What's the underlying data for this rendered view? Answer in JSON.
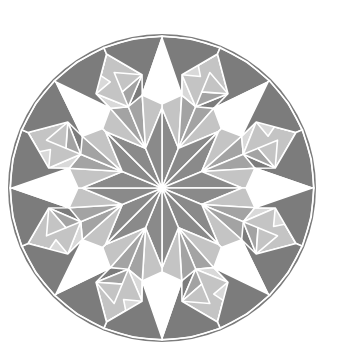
{
  "figure": {
    "width": 338,
    "height": 361,
    "center": [
      162,
      188
    ],
    "circle_radius": 153,
    "symmetry": 8
  },
  "colors": {
    "background": "#ffffff",
    "seam": "#ffffff",
    "rim": "#e6e6e6",
    "dark": "#7c7c7c",
    "star_rhombus": "#8a8a8a",
    "medium": "#a3a3a3",
    "light": "#c4c4c4",
    "pale": "#d9d9d9",
    "white_point": "#ffffff"
  },
  "sector_polygons": [
    {
      "name": "inner-rhombus-half",
      "fill": "star_rhombus",
      "pts": [
        [
          0,
          0
        ],
        [
          80,
          0
        ],
        [
          43,
          22.5
        ]
      ]
    },
    {
      "name": "white-star-point-half",
      "fill": "white_point",
      "pts": [
        [
          150,
          0
        ],
        [
          95,
          12
        ],
        [
          84,
          0
        ]
      ]
    },
    {
      "name": "inner-light-triangle",
      "fill": "light",
      "pts": [
        [
          80,
          0
        ],
        [
          84,
          0
        ],
        [
          95,
          12
        ],
        [
          43,
          22.5
        ]
      ]
    },
    {
      "name": "ring-medium-a",
      "fill": "medium",
      "pts": [
        [
          43,
          22.5
        ],
        [
          95,
          12
        ],
        [
          88,
          22.5
        ]
      ]
    },
    {
      "name": "ring-pale-b",
      "fill": "pale",
      "pts": [
        [
          95,
          12
        ],
        [
          115,
          10
        ],
        [
          88,
          22.5
        ]
      ]
    },
    {
      "name": "patch-square-light",
      "fill": "light",
      "pts": [
        [
          88,
          22.5
        ],
        [
          115,
          10
        ],
        [
          145,
          22.5
        ],
        [
          115,
          35
        ]
      ]
    },
    {
      "name": "patch-tri-medium-1",
      "fill": "medium",
      "pts": [
        [
          115,
          10
        ],
        [
          130,
          16
        ],
        [
          145,
          22.5
        ]
      ]
    },
    {
      "name": "patch-tri-pale-2",
      "fill": "pale",
      "pts": [
        [
          115,
          10
        ],
        [
          130,
          16
        ],
        [
          118,
          19
        ]
      ]
    },
    {
      "name": "patch-tri-medium-3",
      "fill": "medium",
      "pts": [
        [
          88,
          22.5
        ],
        [
          104,
          22.5
        ],
        [
          115,
          35
        ]
      ]
    },
    {
      "name": "patch-tri-light-4",
      "fill": "light",
      "pts": [
        [
          104,
          22.5
        ],
        [
          125,
          22.5
        ],
        [
          115,
          35
        ]
      ]
    },
    {
      "name": "dark-rim-left",
      "fill": "dark",
      "pts": [
        [
          150,
          0
        ],
        [
          152,
          0
        ],
        [
          152,
          11
        ],
        [
          152,
          22.5
        ],
        [
          145,
          22.5
        ],
        [
          115,
          10
        ],
        [
          95,
          12
        ]
      ]
    },
    {
      "name": "dark-rim-right",
      "fill": "dark",
      "pts": [
        [
          145,
          22.5
        ],
        [
          152,
          22.5
        ],
        [
          152,
          34
        ],
        [
          152,
          45
        ],
        [
          150,
          45
        ],
        [
          95,
          33
        ],
        [
          115,
          35
        ]
      ]
    },
    {
      "name": "white-star-point-half-b",
      "fill": "white_point",
      "pts": [
        [
          150,
          45
        ],
        [
          95,
          33
        ],
        [
          84,
          45
        ]
      ]
    },
    {
      "name": "ring-medium-c",
      "fill": "medium",
      "pts": [
        [
          43,
          22.5
        ],
        [
          95,
          33
        ],
        [
          88,
          22.5
        ]
      ]
    },
    {
      "name": "inner-light-triangle-b",
      "fill": "light",
      "pts": [
        [
          80,
          45
        ],
        [
          84,
          45
        ],
        [
          95,
          33
        ],
        [
          43,
          22.5
        ]
      ]
    },
    {
      "name": "inner-rhombus-half-b",
      "fill": "star_rhombus",
      "pts": [
        [
          0,
          0
        ],
        [
          80,
          45
        ],
        [
          43,
          22.5
        ]
      ]
    }
  ]
}
